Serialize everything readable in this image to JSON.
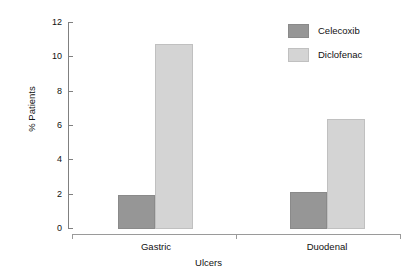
{
  "chart_data": {
    "type": "bar",
    "title": "",
    "subtitle": "",
    "xlabel": "Ulcers",
    "ylabel": "% Patients",
    "categories": [
      "Gastric",
      "Duodenal"
    ],
    "series": [
      {
        "name": "Celecoxib",
        "values": [
          2.0,
          2.15
        ],
        "color": "#969696"
      },
      {
        "name": "Diclofenac",
        "values": [
          10.75,
          6.35
        ],
        "color": "#d4d4d4"
      }
    ],
    "ylim": [
      0,
      12
    ],
    "yticks": [
      0,
      2,
      4,
      6,
      8,
      10,
      12
    ],
    "ytick_labels": [
      "0",
      "2",
      "4",
      "6",
      "8",
      "10",
      "12"
    ],
    "grid": false,
    "legend_position": "top-right",
    "grouped": true,
    "bar_gap": 0
  },
  "legend": {
    "entries": [
      {
        "label": "Celecoxib",
        "swatch": "legend-swatch-celecoxib"
      },
      {
        "label": "Diclofenac",
        "swatch": "legend-swatch-diclofenac"
      }
    ]
  },
  "axes": {
    "y_title": "% Patients",
    "x_title": "Ulcers",
    "y_tick_labels": [
      "12",
      "10",
      "8",
      "6",
      "4",
      "2",
      "0"
    ],
    "x_group_labels": [
      "Gastric",
      "Duodenal"
    ]
  }
}
